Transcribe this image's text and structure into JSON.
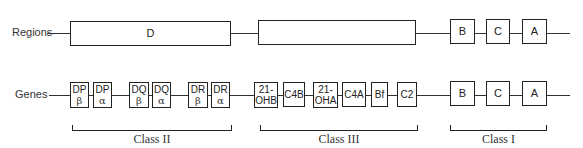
{
  "regions_row": {
    "label": "Regions",
    "boxes": [
      {
        "label": "D"
      },
      {
        "label": ""
      },
      {
        "label": "B"
      },
      {
        "label": "C"
      },
      {
        "label": "A"
      }
    ]
  },
  "genes_row": {
    "label": "Genes",
    "boxes": [
      {
        "top": "DP",
        "bottom": "β"
      },
      {
        "top": "DP",
        "bottom": "α"
      },
      {
        "top": "DQ",
        "bottom": "β"
      },
      {
        "top": "DQ",
        "bottom": "α"
      },
      {
        "top": "DR",
        "bottom": "β"
      },
      {
        "top": "DR",
        "bottom": "α"
      },
      {
        "top": "21-",
        "bottom": "OHB"
      },
      {
        "top": "C4B",
        "bottom": ""
      },
      {
        "top": "21-",
        "bottom": "OHA"
      },
      {
        "top": "C4A",
        "bottom": ""
      },
      {
        "top": "Bf",
        "bottom": ""
      },
      {
        "top": "C2",
        "bottom": ""
      },
      {
        "top": "B",
        "bottom": ""
      },
      {
        "top": "C",
        "bottom": ""
      },
      {
        "top": "A",
        "bottom": ""
      }
    ]
  },
  "classes": [
    {
      "label": "Class II"
    },
    {
      "label": "Class III"
    },
    {
      "label": "Class I"
    }
  ]
}
